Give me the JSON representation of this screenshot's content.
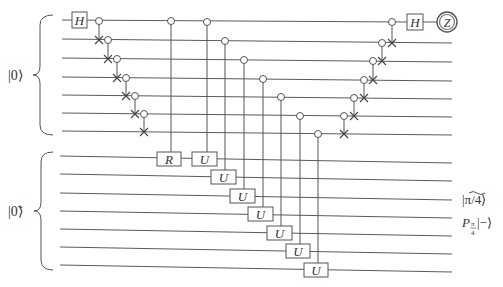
{
  "diagram": {
    "type": "quantum-circuit",
    "registers": [
      {
        "name": "upper",
        "input_label": "|0⟩",
        "wires": 7
      },
      {
        "name": "lower",
        "input_label": "|0̃⟩",
        "wires": 7
      }
    ],
    "gates": {
      "hadamard_label": "H",
      "rotation_label": "R",
      "unitary_label": "U",
      "measurement_label": "Z"
    },
    "left_cnot_cascade": [
      {
        "control_wire": 1,
        "target_wire": 2
      },
      {
        "control_wire": 2,
        "target_wire": 3
      },
      {
        "control_wire": 3,
        "target_wire": 4
      },
      {
        "control_wire": 4,
        "target_wire": 5
      },
      {
        "control_wire": 5,
        "target_wire": 6
      },
      {
        "control_wire": 6,
        "target_wire": 7
      }
    ],
    "controlled_gates": [
      {
        "control_wire": 1,
        "target_wire": 8,
        "gate": "R"
      },
      {
        "control_wire": 1,
        "target_wire": 8,
        "gate": "U"
      },
      {
        "control_wire": 2,
        "target_wire": 9,
        "gate": "U"
      },
      {
        "control_wire": 3,
        "target_wire": 10,
        "gate": "U"
      },
      {
        "control_wire": 4,
        "target_wire": 11,
        "gate": "U"
      },
      {
        "control_wire": 5,
        "target_wire": 12,
        "gate": "U"
      },
      {
        "control_wire": 6,
        "target_wire": 13,
        "gate": "U"
      },
      {
        "control_wire": 7,
        "target_wire": 14,
        "gate": "U"
      }
    ],
    "right_cnot_cascade": [
      {
        "control_wire": 6,
        "target_wire": 7
      },
      {
        "control_wire": 5,
        "target_wire": 6
      },
      {
        "control_wire": 4,
        "target_wire": 5
      },
      {
        "control_wire": 3,
        "target_wire": 4
      },
      {
        "control_wire": 2,
        "target_wire": 3
      },
      {
        "control_wire": 1,
        "target_wire": 2
      }
    ],
    "output_labels": {
      "state": "|π/4⟩",
      "operator_P": "P",
      "operator_sub_num": "π",
      "operator_sub_den": "4",
      "operator_ket": "|−⟩"
    }
  }
}
